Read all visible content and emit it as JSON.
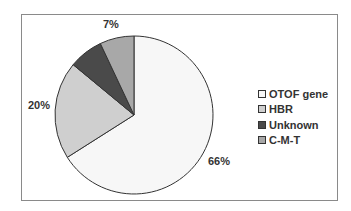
{
  "chart_data": {
    "type": "pie",
    "title": "",
    "categories": [
      "OTOF gene",
      "HBR",
      "Unknown",
      "C-M-T"
    ],
    "values": [
      66,
      20,
      7,
      7
    ],
    "unit": "%",
    "colors": [
      "#f7f7f7",
      "#cfcfcf",
      "#4a4a4a",
      "#a8a8a8"
    ],
    "data_labels": [
      {
        "category": "OTOF gene",
        "text": "66%"
      },
      {
        "category": "HBR",
        "text": "20%"
      },
      {
        "category": "Unknown + C-M-T",
        "text": "7%"
      }
    ],
    "start_angle": "12 o'clock",
    "direction": "clockwise",
    "legend_position": "right"
  },
  "labels": {
    "otof": "66%",
    "hbr": "20%",
    "top": "7%"
  },
  "legend": {
    "items": [
      {
        "label": "OTOF gene",
        "color": "#f7f7f7"
      },
      {
        "label": "HBR",
        "color": "#cfcfcf"
      },
      {
        "label": "Unknown",
        "color": "#4a4a4a"
      },
      {
        "label": "C-M-T",
        "color": "#a8a8a8"
      }
    ]
  }
}
